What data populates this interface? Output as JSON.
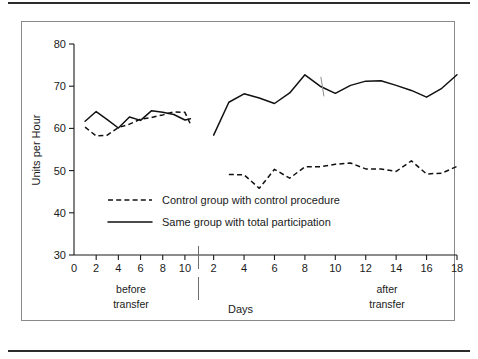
{
  "figure": {
    "y_axis_title": "Units per Hour",
    "x_axis_title": "Days",
    "section_before_line1": "before",
    "section_before_line2": "transfer",
    "section_after_line1": "after",
    "section_after_line2": "transfer"
  },
  "legend": {
    "entries": [
      {
        "label": "Control group with control procedure",
        "style": "dashed"
      },
      {
        "label": "Same group with total participation",
        "style": "solid"
      }
    ]
  },
  "y_ticks": [
    "30",
    "40",
    "50",
    "60",
    "70",
    "80"
  ],
  "x_ticks_before": [
    "0",
    "2",
    "4",
    "6",
    "8",
    "10"
  ],
  "x_ticks_after": [
    "2",
    "4",
    "6",
    "8",
    "10",
    "12",
    "14",
    "16",
    "18"
  ],
  "chart_data": {
    "type": "line",
    "title": "",
    "xlabel": "Days",
    "ylabel": "Units per Hour",
    "ylim": [
      30,
      80
    ],
    "ytick_step": 10,
    "grid": false,
    "legend_position": "inside-lower-left",
    "panels": [
      {
        "name": "before transfer",
        "xlim": [
          0,
          11
        ],
        "xticks": [
          0,
          2,
          4,
          6,
          8,
          10
        ],
        "series": [
          {
            "name": "Control group with control procedure",
            "style": "dashed",
            "x": [
              1,
              2,
              3,
              4,
              5,
              6,
              7,
              8,
              9,
              10,
              10.5
            ],
            "values": [
              60.3,
              58.2,
              58.4,
              60.2,
              61.0,
              62.2,
              62.6,
              63.2,
              63.9,
              63.8,
              61.0
            ]
          },
          {
            "name": "Same group with total participation",
            "style": "solid",
            "x": [
              1,
              2,
              3,
              4,
              5,
              6,
              7,
              8,
              9,
              10,
              10.5
            ],
            "values": [
              61.7,
              64.0,
              62.1,
              60.1,
              62.7,
              61.9,
              64.2,
              63.8,
              63.3,
              62.0,
              62.3
            ]
          }
        ]
      },
      {
        "name": "after transfer",
        "xlim": [
          1.3,
          18
        ],
        "xticks": [
          2,
          4,
          6,
          8,
          10,
          12,
          14,
          16,
          18
        ],
        "series": [
          {
            "name": "Control group with control procedure",
            "style": "dashed",
            "x": [
              3,
              4,
              5,
              6,
              7,
              8,
              9,
              10,
              11,
              12,
              13,
              14,
              15,
              16,
              17,
              18
            ],
            "values": [
              49.1,
              49.0,
              45.8,
              50.3,
              48.2,
              50.9,
              50.9,
              51.5,
              51.8,
              50.4,
              50.4,
              49.8,
              52.3,
              49.2,
              49.4,
              51.0
            ]
          },
          {
            "name": "Same group with total participation",
            "style": "solid",
            "x": [
              2,
              3,
              4,
              5,
              6,
              7,
              8,
              9,
              10,
              11,
              12,
              13,
              14,
              15,
              16,
              17,
              18
            ],
            "values": [
              58.4,
              66.2,
              68.2,
              67.2,
              65.9,
              68.4,
              72.7,
              70.0,
              68.3,
              70.2,
              71.2,
              71.3,
              70.2,
              69.0,
              67.4,
              69.5,
              72.7
            ]
          }
        ]
      }
    ]
  }
}
